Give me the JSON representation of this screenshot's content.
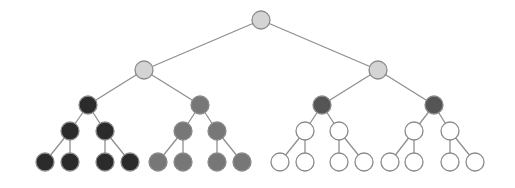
{
  "diagram": {
    "type": "binary-tree",
    "levels": 5,
    "colors": {
      "root_fill": "#d4d4d4",
      "level1_fill": "#d4d4d4",
      "black_fill": "#2b2b2b",
      "gray_fill": "#777777",
      "dark_gray_fill": "#555555",
      "white_fill": "#ffffff",
      "stroke": "#8a8a8a",
      "edge": "#8f8f8f"
    },
    "nodes": [
      {
        "id": "n0",
        "x": 261,
        "y": 20,
        "r": 9,
        "fill": "root_fill"
      },
      {
        "id": "n1",
        "x": 144,
        "y": 70,
        "r": 9,
        "fill": "level1_fill"
      },
      {
        "id": "n2",
        "x": 378,
        "y": 70,
        "r": 9,
        "fill": "level1_fill"
      },
      {
        "id": "n3",
        "x": 88,
        "y": 105,
        "r": 9,
        "fill": "black_fill"
      },
      {
        "id": "n4",
        "x": 200,
        "y": 105,
        "r": 9,
        "fill": "gray_fill"
      },
      {
        "id": "n5",
        "x": 322,
        "y": 105,
        "r": 9,
        "fill": "dark_gray_fill"
      },
      {
        "id": "n6",
        "x": 434,
        "y": 105,
        "r": 9,
        "fill": "dark_gray_fill"
      },
      {
        "id": "n7",
        "x": 70,
        "y": 131,
        "r": 9,
        "fill": "black_fill"
      },
      {
        "id": "n8",
        "x": 105,
        "y": 131,
        "r": 9,
        "fill": "black_fill"
      },
      {
        "id": "n9",
        "x": 183,
        "y": 131,
        "r": 9,
        "fill": "gray_fill"
      },
      {
        "id": "n10",
        "x": 217,
        "y": 131,
        "r": 9,
        "fill": "gray_fill"
      },
      {
        "id": "n11",
        "x": 305,
        "y": 131,
        "r": 9,
        "fill": "white_fill"
      },
      {
        "id": "n12",
        "x": 339,
        "y": 131,
        "r": 9,
        "fill": "white_fill"
      },
      {
        "id": "n13",
        "x": 414,
        "y": 131,
        "r": 9,
        "fill": "white_fill"
      },
      {
        "id": "n14",
        "x": 450,
        "y": 131,
        "r": 9,
        "fill": "white_fill"
      },
      {
        "id": "n15",
        "x": 45,
        "y": 162,
        "r": 9,
        "fill": "black_fill"
      },
      {
        "id": "n16",
        "x": 70,
        "y": 162,
        "r": 9,
        "fill": "black_fill"
      },
      {
        "id": "n17",
        "x": 105,
        "y": 162,
        "r": 9,
        "fill": "black_fill"
      },
      {
        "id": "n18",
        "x": 130,
        "y": 162,
        "r": 9,
        "fill": "black_fill"
      },
      {
        "id": "n19",
        "x": 158,
        "y": 162,
        "r": 9,
        "fill": "gray_fill"
      },
      {
        "id": "n20",
        "x": 183,
        "y": 162,
        "r": 9,
        "fill": "gray_fill"
      },
      {
        "id": "n21",
        "x": 217,
        "y": 162,
        "r": 9,
        "fill": "gray_fill"
      },
      {
        "id": "n22",
        "x": 242,
        "y": 162,
        "r": 9,
        "fill": "gray_fill"
      },
      {
        "id": "n23",
        "x": 280,
        "y": 162,
        "r": 9,
        "fill": "white_fill"
      },
      {
        "id": "n24",
        "x": 305,
        "y": 162,
        "r": 9,
        "fill": "white_fill"
      },
      {
        "id": "n25",
        "x": 339,
        "y": 162,
        "r": 9,
        "fill": "white_fill"
      },
      {
        "id": "n26",
        "x": 364,
        "y": 162,
        "r": 9,
        "fill": "white_fill"
      },
      {
        "id": "n27",
        "x": 390,
        "y": 162,
        "r": 9,
        "fill": "white_fill"
      },
      {
        "id": "n28",
        "x": 414,
        "y": 162,
        "r": 9,
        "fill": "white_fill"
      },
      {
        "id": "n29",
        "x": 450,
        "y": 162,
        "r": 9,
        "fill": "white_fill"
      },
      {
        "id": "n30",
        "x": 475,
        "y": 162,
        "r": 9,
        "fill": "white_fill"
      }
    ],
    "edges": [
      [
        "n0",
        "n1"
      ],
      [
        "n0",
        "n2"
      ],
      [
        "n1",
        "n3"
      ],
      [
        "n1",
        "n4"
      ],
      [
        "n2",
        "n5"
      ],
      [
        "n2",
        "n6"
      ],
      [
        "n3",
        "n7"
      ],
      [
        "n3",
        "n8"
      ],
      [
        "n4",
        "n9"
      ],
      [
        "n4",
        "n10"
      ],
      [
        "n5",
        "n11"
      ],
      [
        "n5",
        "n12"
      ],
      [
        "n6",
        "n13"
      ],
      [
        "n6",
        "n14"
      ],
      [
        "n7",
        "n15"
      ],
      [
        "n7",
        "n16"
      ],
      [
        "n8",
        "n17"
      ],
      [
        "n8",
        "n18"
      ],
      [
        "n9",
        "n19"
      ],
      [
        "n9",
        "n20"
      ],
      [
        "n10",
        "n21"
      ],
      [
        "n10",
        "n22"
      ],
      [
        "n11",
        "n23"
      ],
      [
        "n11",
        "n24"
      ],
      [
        "n12",
        "n25"
      ],
      [
        "n12",
        "n26"
      ],
      [
        "n13",
        "n27"
      ],
      [
        "n13",
        "n28"
      ],
      [
        "n14",
        "n29"
      ],
      [
        "n14",
        "n30"
      ]
    ]
  }
}
